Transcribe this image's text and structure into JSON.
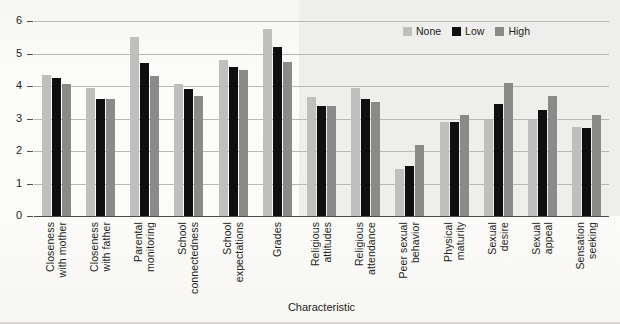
{
  "chart_data": {
    "type": "bar",
    "title": "",
    "xlabel": "Characteristic",
    "ylabel": "",
    "ylim": [
      0,
      6
    ],
    "yticks": [
      0,
      1,
      2,
      3,
      4,
      5,
      6
    ],
    "grid": true,
    "legend_position": "top-right",
    "categories": [
      "Closeness with mother",
      "Closeness with father",
      "Parental monitoring",
      "School connectedness",
      "School expectations",
      "Grades",
      "Religious attitudes",
      "Religious attendance",
      "Peer sexual behavior",
      "Physical maturity",
      "Sexual desire",
      "Sexual appeal",
      "Sensation seeking"
    ],
    "category_lines": [
      [
        "Closeness",
        "with mother"
      ],
      [
        "Closeness",
        "with father"
      ],
      [
        "Parental",
        "monitoring"
      ],
      [
        "School",
        "connectedness"
      ],
      [
        "School",
        "expectations"
      ],
      [
        "Grades"
      ],
      [
        "Religious",
        "attitudes"
      ],
      [
        "Religious",
        "attendance"
      ],
      [
        "Peer sexual",
        "behavior"
      ],
      [
        "Physical",
        "maturity"
      ],
      [
        "Sexual",
        "desire"
      ],
      [
        "Sexual",
        "appeal"
      ],
      [
        "Sensation",
        "seeking"
      ]
    ],
    "series": [
      {
        "name": "None",
        "color": "#bfbfbd",
        "values": [
          4.35,
          3.95,
          5.5,
          4.05,
          4.8,
          5.75,
          3.65,
          3.95,
          1.45,
          2.9,
          2.95,
          2.95,
          2.75
        ]
      },
      {
        "name": "Low",
        "color": "#0f0f0f",
        "values": [
          4.25,
          3.6,
          4.7,
          3.9,
          4.6,
          5.2,
          3.4,
          3.6,
          1.55,
          2.9,
          3.45,
          3.25,
          2.7
        ]
      },
      {
        "name": "High",
        "color": "#8a8a88",
        "values": [
          4.05,
          3.6,
          4.3,
          3.7,
          4.5,
          4.75,
          3.4,
          3.5,
          2.2,
          3.1,
          4.1,
          3.7,
          3.1
        ]
      }
    ]
  },
  "legend": {
    "items": [
      {
        "label": "None",
        "key": "none"
      },
      {
        "label": "Low",
        "key": "low"
      },
      {
        "label": "High",
        "key": "high"
      }
    ]
  },
  "axis": {
    "x_title": "Characteristic"
  }
}
